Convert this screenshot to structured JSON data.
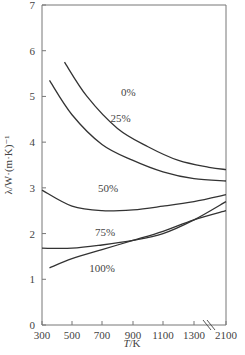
{
  "chart_data": {
    "type": "line",
    "title": "",
    "xlabel": "T/K",
    "ylabel": "λ/W·(m·K)⁻¹",
    "xlim": [
      300,
      2100
    ],
    "ylim": [
      0,
      7
    ],
    "x_ticks": [
      "300",
      "500",
      "700",
      "900",
      "1100",
      "1300",
      "2100"
    ],
    "y_ticks": [
      "0",
      "1",
      "2",
      "3",
      "4",
      "5",
      "6",
      "7"
    ],
    "axis_break": "between 1300 and 2100",
    "grid": false,
    "legend": "inline curve labels",
    "series": [
      {
        "name": "0%",
        "x": [
          450,
          600,
          800,
          1000,
          1200,
          1400,
          2100
        ],
        "y": [
          5.75,
          5.0,
          4.3,
          3.9,
          3.6,
          3.45,
          3.4
        ]
      },
      {
        "name": "25%",
        "x": [
          350,
          500,
          700,
          900,
          1100,
          1300,
          2100
        ],
        "y": [
          5.35,
          4.6,
          3.95,
          3.6,
          3.35,
          3.2,
          3.15
        ]
      },
      {
        "name": "50%",
        "x": [
          300,
          500,
          700,
          900,
          1100,
          1300,
          2100
        ],
        "y": [
          2.95,
          2.6,
          2.5,
          2.52,
          2.6,
          2.7,
          2.85
        ]
      },
      {
        "name": "75%",
        "x": [
          300,
          500,
          700,
          900,
          1100,
          1300,
          2100
        ],
        "y": [
          1.68,
          1.68,
          1.75,
          1.85,
          2.0,
          2.3,
          2.7
        ]
      },
      {
        "name": "100%",
        "x": [
          350,
          500,
          700,
          900,
          1100,
          1300,
          2100
        ],
        "y": [
          1.25,
          1.45,
          1.65,
          1.85,
          2.05,
          2.3,
          2.5
        ]
      }
    ],
    "curve_labels": [
      {
        "text": "0%",
        "x": 870,
        "y": 5.0
      },
      {
        "text": "25%",
        "x": 820,
        "y": 4.45
      },
      {
        "text": "50%",
        "x": 740,
        "y": 2.9
      },
      {
        "text": "75%",
        "x": 720,
        "y": 1.95
      },
      {
        "text": "100%",
        "x": 700,
        "y": 1.15
      }
    ]
  }
}
